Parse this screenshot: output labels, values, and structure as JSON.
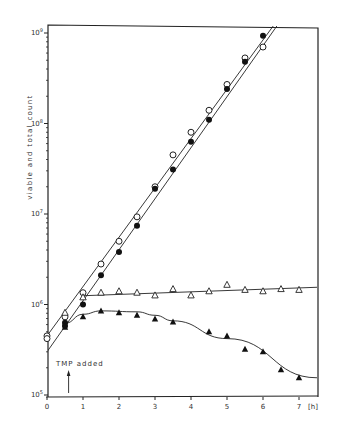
{
  "chart_data": {
    "type": "scatter",
    "title": "",
    "xlabel": "[h]",
    "ylabel": "viable and total count",
    "xlim": [
      0,
      7.5
    ],
    "ylim": [
      100000,
      1400000000
    ],
    "yscale": "log",
    "grid": false,
    "legend": "none",
    "x_ticks": [
      0,
      1,
      2,
      3,
      4,
      5,
      6,
      7
    ],
    "x_tick_labels": [
      "0",
      "1",
      "2",
      "3",
      "4",
      "5",
      "6",
      "7"
    ],
    "y_ticks": [
      {
        "base": "10",
        "exp": "5",
        "value": 100000
      },
      {
        "base": "10",
        "exp": "6",
        "value": 1000000
      },
      {
        "base": "10",
        "exp": "7",
        "value": 10000000
      },
      {
        "base": "10",
        "exp": "8",
        "value": 100000000
      },
      {
        "base": "10",
        "exp": "9",
        "value": 1000000000
      }
    ],
    "annotations": [
      {
        "text": "TMP added",
        "arrow_x": 0.6
      }
    ],
    "series": [
      {
        "name": "total count (control)",
        "marker": "open-circle",
        "x": [
          0,
          0,
          0.5,
          1,
          1.5,
          2,
          2.5,
          3,
          3.5,
          4,
          4.5,
          5,
          5.5,
          6
        ],
        "values": [
          450000,
          420000,
          730000,
          1350000,
          2800000,
          5000000,
          9300000,
          20000000,
          45000000,
          80000000,
          140000000,
          270000000,
          530000000,
          700000000
        ]
      },
      {
        "name": "viable count (control)",
        "marker": "filled-circle",
        "x": [
          0.5,
          0.5,
          1,
          1.5,
          2,
          2.5,
          3,
          3.5,
          4,
          4.5,
          5,
          5.5,
          6
        ],
        "values": [
          630000,
          580000,
          1000000,
          2100000,
          3800000,
          7400000,
          19000000,
          31000000,
          63000000,
          110000000,
          240000000,
          480000000,
          930000000
        ]
      },
      {
        "name": "total count (TMP)",
        "marker": "open-triangle",
        "x": [
          0.5,
          1,
          1.5,
          2,
          2.5,
          3,
          3.5,
          4,
          4.5,
          5,
          5.5,
          6,
          6.5,
          7
        ],
        "values": [
          810000,
          1200000,
          1350000,
          1400000,
          1350000,
          1260000,
          1480000,
          1260000,
          1400000,
          1650000,
          1450000,
          1400000,
          1480000,
          1450000
        ]
      },
      {
        "name": "viable count (TMP)",
        "marker": "filled-triangle",
        "x": [
          0.5,
          1,
          1.5,
          2,
          2.5,
          3,
          3.5,
          4.5,
          5,
          5.5,
          6,
          6.5,
          7
        ],
        "values": [
          560000,
          730000,
          850000,
          810000,
          760000,
          690000,
          640000,
          500000,
          450000,
          320000,
          300000,
          190000,
          155000
        ]
      }
    ],
    "fit_lines": [
      {
        "name": "total control fit",
        "x": [
          0,
          6.35
        ],
        "values": [
          450000,
          1300000000
        ]
      },
      {
        "name": "viable control fit",
        "x": [
          0,
          6.45
        ],
        "values": [
          300000,
          1300000000
        ]
      },
      {
        "name": "total TMP fit",
        "x": [
          1,
          7.5
        ],
        "values": [
          1250000,
          1550000
        ]
      },
      {
        "name": "viable TMP fit",
        "x": [
          0.5,
          1,
          1.5,
          2.5,
          3,
          3.5,
          5,
          7.5
        ],
        "values": [
          620000,
          780000,
          850000,
          830000,
          760000,
          660000,
          420000,
          155000
        ]
      }
    ]
  }
}
